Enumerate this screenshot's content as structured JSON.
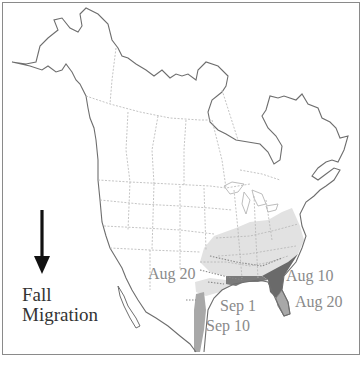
{
  "map": {
    "title": "Fall Migration",
    "legend": {
      "line1": "Fall",
      "line2": "Migration",
      "arrow_icon": "down-arrow-icon"
    },
    "date_labels": [
      {
        "id": "aug20-west",
        "text": "Aug 20"
      },
      {
        "id": "aug10",
        "text": "Aug 10"
      },
      {
        "id": "aug20-east",
        "text": "Aug 20"
      },
      {
        "id": "sep1",
        "text": "Sep 1"
      },
      {
        "id": "sep10",
        "text": "Sep 10"
      }
    ],
    "colors": {
      "outline": "#6e6e6e",
      "border": "#b5b5b5",
      "range_light": "#e2e2e2",
      "range_dark": "#6a6a6a",
      "range_mid": "#a8a8a8",
      "label": "#8a8a8a",
      "frame": "#8a8a8a"
    }
  }
}
